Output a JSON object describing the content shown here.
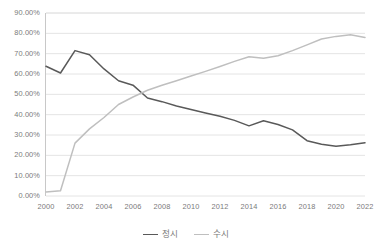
{
  "chart_data": {
    "type": "line",
    "title": "",
    "xlabel": "",
    "ylabel": "",
    "xlim": [
      2000,
      2022
    ],
    "ylim": [
      0,
      0.9
    ],
    "grid": true,
    "grid_axis": "y",
    "legend_position": "bottom",
    "y_tick_labels": [
      "90.00%",
      "80.00%",
      "70.00%",
      "60.00%",
      "50.00%",
      "40.00%",
      "30.00%",
      "20.00%",
      "10.00%",
      "0.00%"
    ],
    "y_tick_values": [
      0.9,
      0.8,
      0.7,
      0.6,
      0.5,
      0.4,
      0.3,
      0.2,
      0.1,
      0.0
    ],
    "x_tick_labels": [
      "2000",
      "2002",
      "2004",
      "2006",
      "2008",
      "2010",
      "2012",
      "2014",
      "2016",
      "2018",
      "2020",
      "2022"
    ],
    "x_tick_values": [
      2000,
      2002,
      2004,
      2006,
      2008,
      2010,
      2012,
      2014,
      2016,
      2018,
      2020,
      2022
    ],
    "x": [
      2000,
      2001,
      2002,
      2003,
      2004,
      2005,
      2006,
      2007,
      2008,
      2009,
      2010,
      2011,
      2012,
      2013,
      2014,
      2015,
      2016,
      2017,
      2018,
      2019,
      2020,
      2021,
      2022
    ],
    "series": [
      {
        "name": "정시",
        "color": "#595959",
        "values": [
          0.638,
          0.605,
          0.715,
          0.695,
          0.625,
          0.567,
          0.545,
          0.482,
          0.464,
          0.443,
          0.425,
          0.408,
          0.392,
          0.372,
          0.345,
          0.37,
          0.352,
          0.325,
          0.272,
          0.255,
          0.245,
          0.252,
          0.262
        ]
      },
      {
        "name": "수시",
        "color": "#bfbfbf",
        "values": [
          0.02,
          0.026,
          0.26,
          0.33,
          0.386,
          0.45,
          0.487,
          0.52,
          0.545,
          0.567,
          0.59,
          0.613,
          0.637,
          0.662,
          0.685,
          0.678,
          0.69,
          0.715,
          0.743,
          0.772,
          0.785,
          0.793,
          0.78
        ]
      }
    ]
  },
  "legend": {
    "items": [
      {
        "label": "정시",
        "color": "#595959"
      },
      {
        "label": "수시",
        "color": "#bfbfbf"
      }
    ]
  }
}
